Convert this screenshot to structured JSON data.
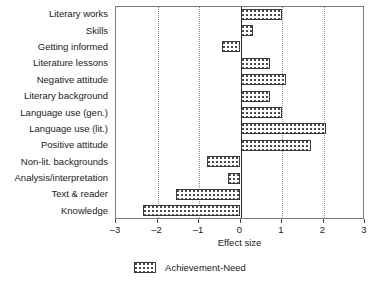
{
  "chart_data": {
    "type": "bar",
    "orientation": "horizontal",
    "title": "",
    "xlabel": "Effect size",
    "ylabel": "",
    "xlim": [
      -3,
      3
    ],
    "xticks": [
      "–3",
      "–2",
      "–1",
      "0",
      "1",
      "2",
      "3"
    ],
    "xtick_values": [
      -3,
      -2,
      -1,
      0,
      1,
      2,
      3
    ],
    "grid": "vertical-dotted",
    "legend_position": "bottom-center",
    "categories": [
      "Literary works",
      "Skills",
      "Getting informed",
      "Literature lessons",
      "Negative attitude",
      "Literary background",
      "Language use (gen.)",
      "Language use (lit.)",
      "Positive attitude",
      "Non-lit. backgrounds",
      "Analysis/interpretation",
      "Text & reader",
      "Knowledge"
    ],
    "series": [
      {
        "name": "Achievement-Need",
        "values": [
          1.0,
          0.3,
          -0.45,
          0.7,
          1.1,
          0.7,
          1.0,
          2.05,
          1.7,
          -0.8,
          -0.3,
          -1.55,
          -2.35
        ]
      }
    ]
  },
  "legend": {
    "items": [
      {
        "label": "Achievement-Need",
        "swatch": "dotted-pattern-swatch"
      }
    ]
  },
  "axis": {
    "x_title": "Effect size"
  }
}
